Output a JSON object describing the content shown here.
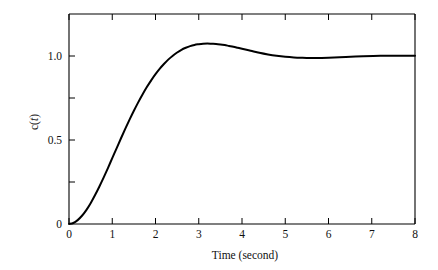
{
  "chart_data": {
    "type": "line",
    "title": "",
    "xlabel": "Time (second)",
    "ylabel": "c(t)",
    "ylabel_parts": {
      "pre": "c(",
      "var": "t",
      "post": ")"
    },
    "xlim": [
      0,
      8
    ],
    "ylim": [
      0,
      1.25
    ],
    "grid": false,
    "legend": null,
    "x_ticks": [
      0,
      1,
      2,
      3,
      4,
      5,
      6,
      7,
      8
    ],
    "x_tick_labels": [
      "0",
      "1",
      "2",
      "3",
      "4",
      "5",
      "6",
      "7",
      "8"
    ],
    "y_ticks": [
      0,
      0.25,
      0.5,
      0.75,
      1.0,
      1.25
    ],
    "y_tick_labels": [
      "0",
      "",
      "0.5",
      "",
      "1.0",
      ""
    ],
    "y_labeled_ticks": [
      {
        "value": 0,
        "label": "0"
      },
      {
        "value": 0.5,
        "label": "0.5"
      },
      {
        "value": 1.0,
        "label": "1.0"
      }
    ],
    "series": [
      {
        "name": "c(t)",
        "color": "#000000",
        "x": [
          0.0,
          0.1,
          0.2,
          0.3,
          0.4,
          0.5,
          0.6,
          0.7,
          0.8,
          0.9,
          1.0,
          1.1,
          1.2,
          1.3,
          1.4,
          1.5,
          1.6,
          1.7,
          1.8,
          1.9,
          2.0,
          2.1,
          2.2,
          2.3,
          2.4,
          2.5,
          2.6,
          2.7,
          2.8,
          2.9,
          3.0,
          3.1,
          3.2,
          3.3,
          3.4,
          3.5,
          3.6,
          3.7,
          3.8,
          3.9,
          4.0,
          4.2,
          4.4,
          4.6,
          4.8,
          5.0,
          5.2,
          5.4,
          5.6,
          5.8,
          6.0,
          6.4,
          6.8,
          7.2,
          7.6,
          8.0
        ],
        "y": [
          0.0,
          0.006,
          0.023,
          0.049,
          0.083,
          0.124,
          0.171,
          0.222,
          0.276,
          0.333,
          0.392,
          0.45,
          0.509,
          0.566,
          0.621,
          0.674,
          0.724,
          0.771,
          0.815,
          0.855,
          0.892,
          0.925,
          0.954,
          0.98,
          1.002,
          1.021,
          1.037,
          1.049,
          1.059,
          1.066,
          1.07,
          1.073,
          1.074,
          1.073,
          1.072,
          1.069,
          1.065,
          1.06,
          1.055,
          1.049,
          1.043,
          1.031,
          1.019,
          1.009,
          1.001,
          0.995,
          0.991,
          0.989,
          0.988,
          0.988,
          0.989,
          0.994,
          0.998,
          1.001,
          1.002,
          1.002
        ],
        "annotations": {
          "peak_value": 1.074,
          "peak_time": 3.2,
          "steady_state": 1.0,
          "initial_value": 0.0,
          "overshoot_percent": 7.4
        }
      }
    ]
  }
}
